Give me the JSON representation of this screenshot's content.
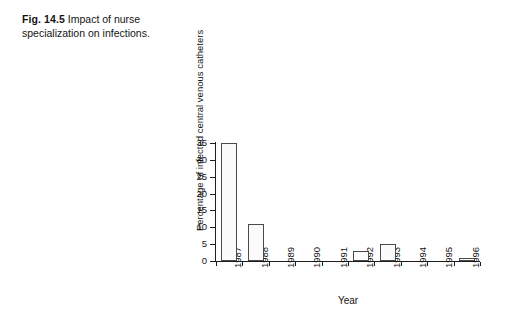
{
  "caption": {
    "label": "Fig. 14.5",
    "text": "Impact of nurse specialization on infections."
  },
  "chart_data": {
    "type": "bar",
    "title": "",
    "xlabel": "Year",
    "ylabel": "Percentage of infected central venous catheters",
    "categories": [
      "1987",
      "1988",
      "1989",
      "1990",
      "1991",
      "1992",
      "1993",
      "1994",
      "1995",
      "1996"
    ],
    "values": [
      35,
      11,
      0,
      0,
      0,
      3,
      5,
      0,
      0,
      1
    ],
    "ylim": [
      0,
      35
    ],
    "yticks": [
      0,
      5,
      10,
      15,
      20,
      25,
      30,
      35
    ],
    "ytick_labels": [
      "0",
      "5",
      "10",
      "15",
      "20",
      "25",
      "30",
      "35"
    ],
    "grid": false,
    "legend": false,
    "bar_color": "#fbfbfb",
    "bar_edge_color": "#4a4a4a",
    "axis_color": "#1d1d1d"
  }
}
